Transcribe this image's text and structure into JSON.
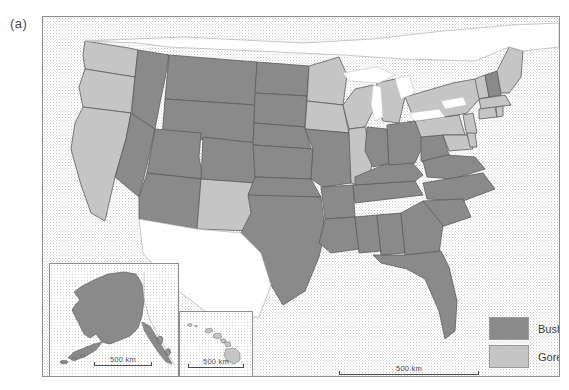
{
  "figure": {
    "panel_label": "(a)",
    "caption_text": ""
  },
  "legend": {
    "position": "bottom-right",
    "items": [
      {
        "label": "Bush",
        "color": "#8a8a8a",
        "swatch_name": "legend-swatch-bush"
      },
      {
        "label": "Gore",
        "color": "#c5c5c5",
        "swatch_name": "legend-swatch-gore"
      }
    ]
  },
  "scalebars": {
    "main": {
      "label": "500 km"
    },
    "alaska": {
      "label": "500 km"
    },
    "hawaii": {
      "label": "500 km"
    }
  },
  "insets": {
    "alaska": {
      "name": "alaska-inset"
    },
    "hawaii": {
      "name": "hawaii-inset"
    }
  },
  "colors": {
    "bush": "#8a8a8a",
    "gore": "#c5c5c5",
    "border": "#5c5c5c",
    "frame": "#8d8d8d",
    "ocean": "#ffffff",
    "text": "#4a4a4a"
  },
  "map_data": {
    "type": "choropleth",
    "title": "",
    "subtitle": "",
    "categories": [
      "Bush",
      "Gore"
    ],
    "states": [
      {
        "code": "WA",
        "winner": "Gore"
      },
      {
        "code": "OR",
        "winner": "Gore"
      },
      {
        "code": "CA",
        "winner": "Gore"
      },
      {
        "code": "NV",
        "winner": "Bush"
      },
      {
        "code": "ID",
        "winner": "Bush"
      },
      {
        "code": "MT",
        "winner": "Bush"
      },
      {
        "code": "WY",
        "winner": "Bush"
      },
      {
        "code": "UT",
        "winner": "Bush"
      },
      {
        "code": "AZ",
        "winner": "Bush"
      },
      {
        "code": "NM",
        "winner": "Gore"
      },
      {
        "code": "CO",
        "winner": "Bush"
      },
      {
        "code": "ND",
        "winner": "Bush"
      },
      {
        "code": "SD",
        "winner": "Bush"
      },
      {
        "code": "NE",
        "winner": "Bush"
      },
      {
        "code": "KS",
        "winner": "Bush"
      },
      {
        "code": "OK",
        "winner": "Bush"
      },
      {
        "code": "TX",
        "winner": "Bush"
      },
      {
        "code": "MN",
        "winner": "Gore"
      },
      {
        "code": "IA",
        "winner": "Gore"
      },
      {
        "code": "MO",
        "winner": "Bush"
      },
      {
        "code": "AR",
        "winner": "Bush"
      },
      {
        "code": "LA",
        "winner": "Bush"
      },
      {
        "code": "WI",
        "winner": "Gore"
      },
      {
        "code": "IL",
        "winner": "Gore"
      },
      {
        "code": "MS",
        "winner": "Bush"
      },
      {
        "code": "AL",
        "winner": "Bush"
      },
      {
        "code": "TN",
        "winner": "Bush"
      },
      {
        "code": "KY",
        "winner": "Bush"
      },
      {
        "code": "IN",
        "winner": "Bush"
      },
      {
        "code": "MI",
        "winner": "Gore"
      },
      {
        "code": "OH",
        "winner": "Bush"
      },
      {
        "code": "GA",
        "winner": "Bush"
      },
      {
        "code": "FL",
        "winner": "Bush"
      },
      {
        "code": "SC",
        "winner": "Bush"
      },
      {
        "code": "NC",
        "winner": "Bush"
      },
      {
        "code": "VA",
        "winner": "Bush"
      },
      {
        "code": "WV",
        "winner": "Bush"
      },
      {
        "code": "PA",
        "winner": "Gore"
      },
      {
        "code": "NY",
        "winner": "Gore"
      },
      {
        "code": "MD",
        "winner": "Gore"
      },
      {
        "code": "DE",
        "winner": "Gore"
      },
      {
        "code": "NJ",
        "winner": "Gore"
      },
      {
        "code": "CT",
        "winner": "Gore"
      },
      {
        "code": "RI",
        "winner": "Gore"
      },
      {
        "code": "MA",
        "winner": "Gore"
      },
      {
        "code": "VT",
        "winner": "Gore"
      },
      {
        "code": "NH",
        "winner": "Bush"
      },
      {
        "code": "ME",
        "winner": "Gore"
      },
      {
        "code": "AK",
        "winner": "Bush"
      },
      {
        "code": "HI",
        "winner": "Gore"
      }
    ]
  }
}
